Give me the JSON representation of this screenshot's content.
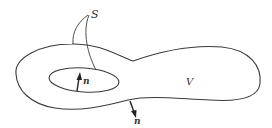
{
  "figure": {
    "labels": {
      "surface": "S",
      "volume": "V",
      "normal_inner": "n",
      "normal_outer": "n"
    },
    "colors": {
      "stroke": "#3a3a3a",
      "background": "#ffffff"
    }
  }
}
